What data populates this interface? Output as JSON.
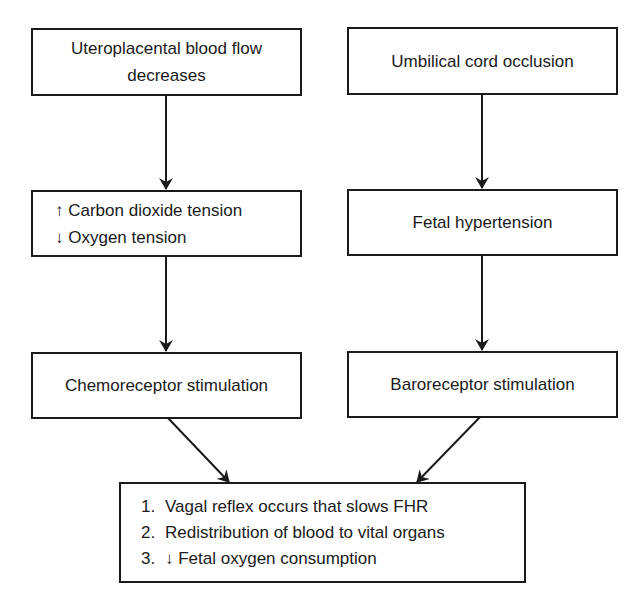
{
  "diagram": {
    "type": "flowchart",
    "left_column": {
      "box1": {
        "lines": [
          "Uteroplacental blood flow",
          "decreases"
        ]
      },
      "box2": {
        "lines": [
          "↑ Carbon dioxide tension",
          "↓ Oxygen tension"
        ]
      },
      "box3": {
        "lines": [
          "Chemoreceptor stimulation"
        ]
      }
    },
    "right_column": {
      "box1": {
        "lines": [
          "Umbilical cord occlusion"
        ]
      },
      "box2": {
        "lines": [
          "Fetal hypertension"
        ]
      },
      "box3": {
        "lines": [
          "Baroreceptor stimulation"
        ]
      }
    },
    "outcome": {
      "items": [
        {
          "num": "1.",
          "text": "Vagal reflex occurs that slows FHR"
        },
        {
          "num": "2.",
          "text": "Redistribution of blood to vital organs"
        },
        {
          "num": "3.",
          "text": "↓ Fetal oxygen consumption"
        }
      ]
    },
    "edges": [
      {
        "from": "Uteroplacental blood flow decreases",
        "to": "↑ Carbon dioxide tension / ↓ Oxygen tension"
      },
      {
        "from": "↑ Carbon dioxide tension / ↓ Oxygen tension",
        "to": "Chemoreceptor stimulation"
      },
      {
        "from": "Umbilical cord occlusion",
        "to": "Fetal hypertension"
      },
      {
        "from": "Fetal hypertension",
        "to": "Baroreceptor stimulation"
      },
      {
        "from": "Chemoreceptor stimulation",
        "to": "outcome"
      },
      {
        "from": "Baroreceptor stimulation",
        "to": "outcome"
      }
    ],
    "colors": {
      "stroke": "#1a1a1a",
      "background": "#ffffff"
    }
  }
}
